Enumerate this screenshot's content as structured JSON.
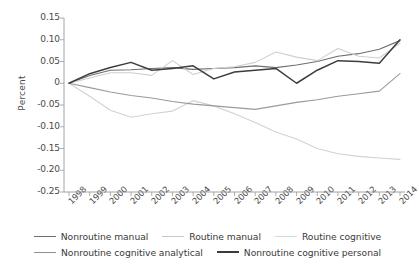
{
  "chart_data": {
    "type": "line",
    "title": "",
    "xlabel": "",
    "ylabel": "Percent",
    "grid": false,
    "legend_position": "bottom",
    "x": [
      1998,
      1999,
      2000,
      2001,
      2002,
      2003,
      2004,
      2005,
      2006,
      2007,
      2008,
      2009,
      2010,
      2011,
      2012,
      2013,
      2014
    ],
    "xtick_labels": [
      "1998",
      "1999",
      "2000",
      "2001",
      "2002",
      "2003",
      "2004",
      "2005",
      "2006",
      "2007",
      "2008",
      "2009",
      "2010",
      "2011",
      "2012",
      "2013",
      "2014"
    ],
    "ytick_labels": [
      "0.15",
      "0.10",
      "0.05",
      "0",
      "-0.05",
      "-0.10",
      "-0.15",
      "-0.20",
      "-0.25"
    ],
    "ytick_values": [
      0.15,
      0.1,
      0.05,
      0,
      -0.05,
      -0.1,
      -0.15,
      -0.2,
      -0.25
    ],
    "ylim": [
      -0.25,
      0.15
    ],
    "xlim": [
      1998,
      2014
    ],
    "series": [
      {
        "name": "Nonroutine manual",
        "color": "#6e6e6e",
        "width": 1.1,
        "values": [
          0,
          0.018,
          0.03,
          0.031,
          0.034,
          0.036,
          0.032,
          0.034,
          0.036,
          0.04,
          0.036,
          0.042,
          0.05,
          0.062,
          0.068,
          0.078,
          0.098
        ]
      },
      {
        "name": "Routine manual",
        "color": "#d2d2d2",
        "width": 1.1,
        "values": [
          0,
          -0.03,
          -0.062,
          -0.078,
          -0.07,
          -0.064,
          -0.04,
          -0.052,
          -0.07,
          -0.09,
          -0.112,
          -0.128,
          -0.15,
          -0.162,
          -0.168,
          -0.172,
          -0.175
        ]
      },
      {
        "name": "Routine cognitive",
        "color": "#cfcfcf",
        "width": 1.1,
        "values": [
          0,
          0.012,
          0.024,
          0.024,
          0.018,
          0.052,
          0.02,
          0.034,
          0.038,
          0.048,
          0.072,
          0.06,
          0.052,
          0.08,
          0.062,
          0.058,
          0.092
        ]
      },
      {
        "name": "Nonroutine cognitive analytical",
        "color": "#9a9a9a",
        "width": 1.1,
        "values": [
          0,
          -0.01,
          -0.02,
          -0.028,
          -0.034,
          -0.042,
          -0.048,
          -0.052,
          -0.056,
          -0.06,
          -0.052,
          -0.044,
          -0.038,
          -0.03,
          -0.024,
          -0.018,
          0.022
        ]
      },
      {
        "name": "Nonroutine cognitive personal",
        "color": "#3d3d3d",
        "width": 1.5,
        "values": [
          0,
          0.022,
          0.036,
          0.048,
          0.03,
          0.034,
          0.04,
          0.01,
          0.026,
          0.03,
          0.034,
          0.0,
          0.03,
          0.052,
          0.05,
          0.046,
          0.1
        ]
      }
    ]
  },
  "legend": {
    "row1": [
      {
        "label": "Nonroutine manual",
        "color": "#6e6e6e",
        "width": 1.4
      },
      {
        "label": "Routine manual",
        "color": "#c9c9c9",
        "width": 1.4
      },
      {
        "label": "Routine cognitive",
        "color": "#d8d8d8",
        "width": 1.4
      }
    ],
    "row2": [
      {
        "label": "Nonroutine cognitive analytical",
        "color": "#8f8f8f",
        "width": 1.4
      },
      {
        "label": "Nonroutine cognitive personal",
        "color": "#3a3a3a",
        "width": 2.2
      }
    ]
  },
  "axis": {
    "color": "#9a9a9a"
  }
}
